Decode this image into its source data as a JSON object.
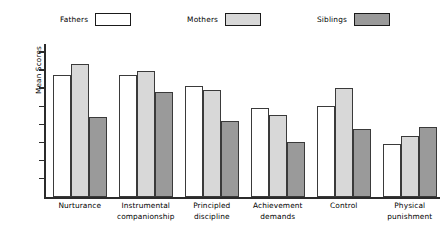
{
  "chart_data": {
    "type": "bar",
    "title": "",
    "subtitle": "",
    "xlabel": "",
    "ylabel": "Mean Scores",
    "ylim": [
      0,
      8
    ],
    "grid": false,
    "y_axis_tick_labels": [],
    "y_axis_tick_count": 8,
    "legend_position": "top",
    "categories": [
      "Nurturance",
      "Instrumental companionship",
      "Principled discipline",
      "Achievement demands",
      "Control",
      "Physical punishment"
    ],
    "category_lines": [
      [
        "Nurturance"
      ],
      [
        "Instrumental",
        "companionship"
      ],
      [
        "Principled",
        "discipline"
      ],
      [
        "Achievement",
        "demands"
      ],
      [
        "Control"
      ],
      [
        "Physical",
        "punishment"
      ]
    ],
    "series": [
      {
        "name": "Fathers",
        "color": "#ffffff",
        "values": [
          6.4,
          6.4,
          5.8,
          4.7,
          4.8,
          2.8
        ]
      },
      {
        "name": "Mothers",
        "color": "#d8d8d8",
        "values": [
          7.0,
          6.6,
          5.6,
          4.3,
          5.7,
          3.2
        ]
      },
      {
        "name": "Siblings",
        "color": "#9a9a9a",
        "values": [
          4.2,
          5.5,
          4.0,
          2.9,
          3.6,
          3.7
        ]
      }
    ]
  },
  "legend": {
    "entries": [
      {
        "label": "Fathers",
        "swatch_color": "#ffffff"
      },
      {
        "label": "Mothers",
        "swatch_color": "#d8d8d8"
      },
      {
        "label": "Siblings",
        "swatch_color": "#9a9a9a"
      }
    ]
  },
  "axes": {
    "y_title": "Mean Scores",
    "axis_color": "#2b2b2b",
    "bar_edge_color": "#3a3a3a"
  }
}
